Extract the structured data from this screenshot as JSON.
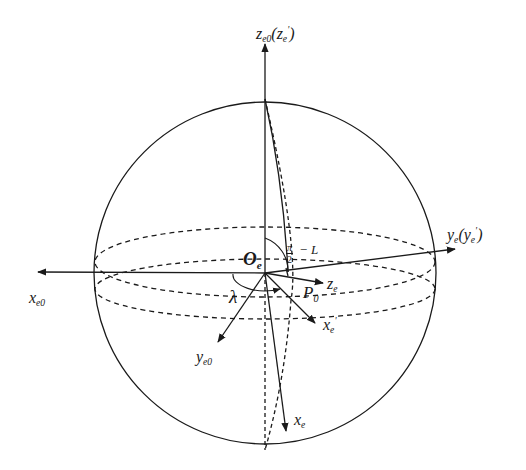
{
  "figure": {
    "type": "coordinate-system diagram on sphere",
    "colors": {
      "stroke": "#1a1a1a",
      "background": "#ffffff"
    },
    "sphere": {
      "center": [
        265,
        272
      ],
      "radius": 172
    },
    "origin_label": {
      "main": "O",
      "sub": "e"
    },
    "axes": [
      {
        "id": "z_e0",
        "main": "z",
        "sub": "e0",
        "paren_main": "z",
        "paren_sub": "e",
        "paren_prime": "'",
        "direction": "up"
      },
      {
        "id": "y_e",
        "main": "y",
        "sub": "e",
        "paren_main": "y",
        "paren_sub": "e",
        "paren_prime": "'",
        "direction": "right"
      },
      {
        "id": "x_e0",
        "main": "x",
        "sub": "e0",
        "direction": "left"
      },
      {
        "id": "y_e0",
        "main": "y",
        "sub": "e0",
        "direction": "lower-left"
      },
      {
        "id": "x_e_prime",
        "main": "x",
        "sub": "e",
        "prime": "'",
        "direction": "lower-right"
      },
      {
        "id": "x_e",
        "main": "x",
        "sub": "e",
        "direction": "down"
      },
      {
        "id": "z_e",
        "main": "z",
        "sub": "e",
        "direction": "right-slightly-down"
      }
    ],
    "point_label": {
      "main": "P",
      "sub": "0"
    },
    "angle_labels": {
      "lambda": "λ",
      "colatitude": {
        "numerator": "π",
        "denominator": "2",
        "suffix": "− L"
      }
    }
  }
}
